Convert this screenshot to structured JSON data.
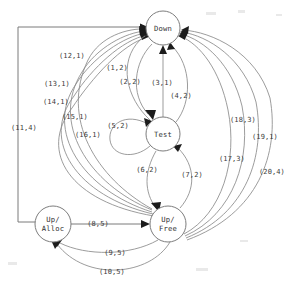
{
  "figure": {
    "kind": "state-transition-diagram",
    "background_color": "#ffffff",
    "line_color": "#8a8a8a",
    "text_color": "#2f2f2f",
    "arrow_color": "#1c1c1c",
    "width": 298,
    "height": 293
  },
  "nodes": [
    {
      "id": "down",
      "label_line1": "Down",
      "label_line2": "",
      "cx": 163,
      "cy": 28,
      "r": 17
    },
    {
      "id": "test",
      "label_line1": "Test",
      "label_line2": "",
      "cx": 163,
      "cy": 134,
      "r": 17
    },
    {
      "id": "up_alloc",
      "label_line1": "Up/",
      "label_line2": "Alloc",
      "cx": 53,
      "cy": 224,
      "r": 18
    },
    {
      "id": "up_free",
      "label_line1": "Up/",
      "label_line2": "Free",
      "cx": 168,
      "cy": 224,
      "r": 18
    }
  ],
  "edges": [
    {
      "id": "e1",
      "label": "(1,2)",
      "from": "test",
      "to": "down",
      "label_x": 117,
      "label_y": 70
    },
    {
      "id": "e2",
      "label": "(2,2)",
      "from": "down",
      "to": "test",
      "label_x": 130,
      "label_y": 84
    },
    {
      "id": "e3",
      "label": "(3,1)",
      "from": "test",
      "to": "down",
      "label_x": 162,
      "label_y": 85
    },
    {
      "id": "e4",
      "label": "(4,2)",
      "from": "test",
      "to": "down",
      "label_x": 181,
      "label_y": 98
    },
    {
      "id": "e5",
      "label": "(5,2)",
      "from": "test",
      "to": "test",
      "label_x": 118,
      "label_y": 128
    },
    {
      "id": "e6",
      "label": "(6,2)",
      "from": "test",
      "to": "up_free",
      "label_x": 147,
      "label_y": 172
    },
    {
      "id": "e7",
      "label": "(7,2)",
      "from": "up_free",
      "to": "test",
      "label_x": 192,
      "label_y": 177
    },
    {
      "id": "e8",
      "label": "(8,5)",
      "from": "up_alloc",
      "to": "up_free",
      "label_x": 98,
      "label_y": 226
    },
    {
      "id": "e9",
      "label": "(9,5)",
      "from": "up_free",
      "to": "up_alloc",
      "label_x": 115,
      "label_y": 255
    },
    {
      "id": "e10",
      "label": "(10,5)",
      "from": "up_free",
      "to": "up_alloc",
      "label_x": 112,
      "label_y": 274
    },
    {
      "id": "e11",
      "label": "(11,4)",
      "from": "up_alloc",
      "to": "down",
      "label_x": 24,
      "label_y": 130
    },
    {
      "id": "e12",
      "label": "(12,1)",
      "from": "up_free",
      "to": "down",
      "label_x": 72,
      "label_y": 58
    },
    {
      "id": "e13",
      "label": "(13,1)",
      "from": "up_free",
      "to": "down",
      "label_x": 57,
      "label_y": 86
    },
    {
      "id": "e14",
      "label": "(14,1)",
      "from": "up_free",
      "to": "down",
      "label_x": 56,
      "label_y": 104
    },
    {
      "id": "e15",
      "label": "(15,1)",
      "from": "up_free",
      "to": "down",
      "label_x": 75,
      "label_y": 119
    },
    {
      "id": "e16",
      "label": "(16,1)",
      "from": "up_free",
      "to": "down",
      "label_x": 88,
      "label_y": 137
    },
    {
      "id": "e17",
      "label": "(17,3)",
      "from": "up_free",
      "to": "down",
      "label_x": 232,
      "label_y": 161
    },
    {
      "id": "e18",
      "label": "(18,3)",
      "from": "up_free",
      "to": "down",
      "label_x": 243,
      "label_y": 122
    },
    {
      "id": "e19",
      "label": "(19,1)",
      "from": "up_free",
      "to": "down",
      "label_x": 265,
      "label_y": 139
    },
    {
      "id": "e20",
      "label": "(20,4)",
      "from": "up_free",
      "to": "down",
      "label_x": 272,
      "label_y": 174
    }
  ]
}
